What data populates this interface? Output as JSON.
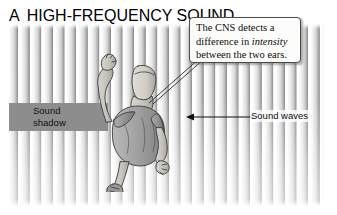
{
  "panel": {
    "letter": "A",
    "title": "HIGH-FREQUENCY SOUND"
  },
  "callout": {
    "line1_pre": "The CNS detects a",
    "line2_pre": "difference in ",
    "line2_em": "intensity",
    "line3": "between the two ears."
  },
  "labels": {
    "sound_shadow_line1": "Sound",
    "sound_shadow_line2": "shadow",
    "sound_waves": "Sound waves"
  },
  "figure": {
    "alt": "aerial view of a person standing between sound waves"
  },
  "colors": {
    "shadow_band": "#8d8d8d",
    "stripe_dark": "#8e8e8e",
    "stripe_light": "#ffffff",
    "text": "#101010",
    "callout_border": "#4a4a4a",
    "callout_fill": "#fcfcfa",
    "skin": "#c9c5c0",
    "garment": "#9e9e9e",
    "outline": "#3a3a3a"
  }
}
